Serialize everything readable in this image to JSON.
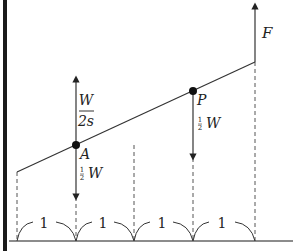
{
  "diagram": {
    "labels": {
      "force_top": "F",
      "point_a": "A",
      "point_p": "P",
      "up_force_num": "W",
      "up_force_den": "2s",
      "half_num": "1",
      "half_den": "2",
      "weight": "W"
    },
    "spans": [
      "1",
      "1",
      "1",
      "1"
    ],
    "colors": {
      "line": "#333333",
      "dashed": "#555555",
      "border": "#1a1a1a"
    }
  }
}
